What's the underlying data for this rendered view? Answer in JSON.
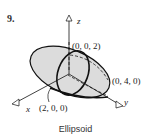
{
  "problem_number": "9.",
  "caption": "Ellipsoid",
  "axes": {
    "x": "x",
    "y": "y",
    "z": "z"
  },
  "points": {
    "z_intercept": "(0, 0, 2)",
    "y_intercept": "(0, 4, 0)",
    "x_intercept": "(2, 0, 0)"
  }
}
